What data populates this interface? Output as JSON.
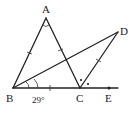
{
  "diagram": {
    "type": "geometry",
    "points": {
      "A": {
        "label": "A",
        "x": 46,
        "y": 18
      },
      "B": {
        "label": "B",
        "x": 13,
        "y": 88
      },
      "C": {
        "label": "C",
        "x": 80,
        "y": 88
      },
      "D": {
        "label": "D",
        "x": 118,
        "y": 32
      },
      "E": {
        "label": "E",
        "x": 109,
        "y": 88
      }
    },
    "segments": [
      "AB",
      "AC",
      "BC",
      "BD",
      "CD",
      "CE"
    ],
    "angle_label": "29°",
    "equal_marks": [
      "AB",
      "AC",
      "BC",
      "CD"
    ],
    "equal_angle_dots": [
      "ACD",
      "DCE"
    ]
  }
}
